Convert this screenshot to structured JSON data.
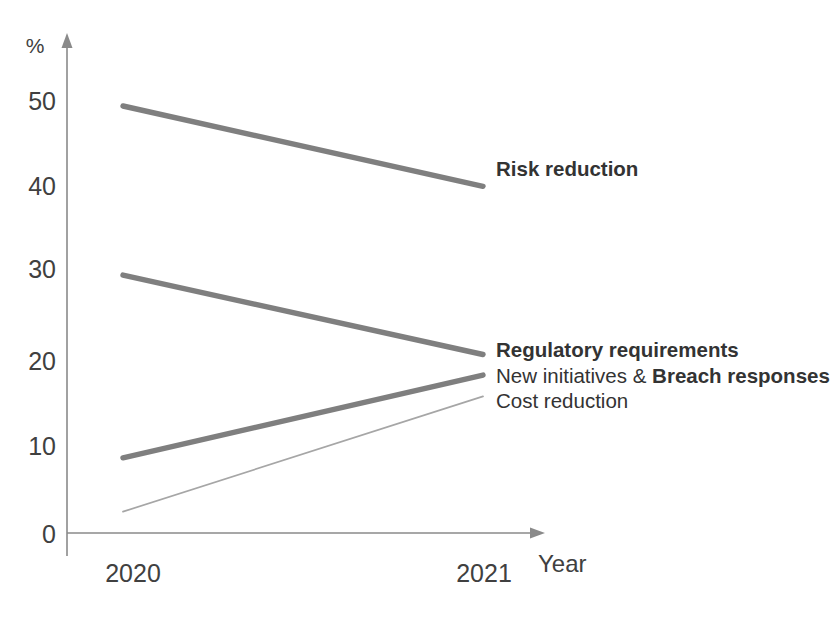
{
  "chart_data": {
    "type": "line",
    "title": "",
    "xlabel": "Year",
    "ylabel": "%",
    "x": [
      "2020",
      "2021"
    ],
    "xlim": [
      2020,
      2021
    ],
    "ylim": [
      0,
      55
    ],
    "yticks": [
      0,
      10,
      20,
      30,
      40,
      50
    ],
    "ytick_labels": [
      "0",
      "10",
      "20",
      "30",
      "40",
      "50"
    ],
    "grid": false,
    "legend_position": "right-inline-end-of-line",
    "series": [
      {
        "name": "Risk reduction",
        "label_prefix": "",
        "label_bold": "Risk reduction",
        "values": [
          50.0,
          40.6
        ],
        "style": "thick",
        "color": "#7f7f7f"
      },
      {
        "name": "Regulatory requirements",
        "label_prefix": "",
        "label_bold": "Regulatory requirements",
        "values": [
          30.2,
          20.9
        ],
        "style": "thick",
        "color": "#7f7f7f"
      },
      {
        "name": "New initiatives & Breach responses",
        "label_prefix": "New initiatives & ",
        "label_bold": "Breach responses",
        "values": [
          8.8,
          18.5
        ],
        "style": "thick",
        "color": "#7f7f7f"
      },
      {
        "name": "Cost reduction",
        "label_prefix": "Cost reduction",
        "label_bold": "",
        "values": [
          2.5,
          16.0
        ],
        "style": "thin",
        "color": "#a6a6a6"
      }
    ]
  },
  "axis": {
    "y_unit_label": "%",
    "x_title": "Year",
    "y_tick_50": "50",
    "y_tick_40": "40",
    "y_tick_30": "30",
    "y_tick_20": "20",
    "y_tick_10": "10",
    "y_tick_0": "0",
    "x_tick_left": "2020",
    "x_tick_right": "2021"
  },
  "labels": {
    "risk_reduction": "Risk reduction",
    "regulatory_requirements": "Regulatory requirements",
    "new_initiatives_prefix": "New initiatives & ",
    "breach_responses": "Breach responses",
    "cost_reduction": "Cost reduction"
  },
  "colors": {
    "line_thick": "#7f7f7f",
    "line_thin": "#a6a6a6",
    "axis": "#8a8a8a",
    "text": "#3c3c3c",
    "background": "#ffffff"
  }
}
